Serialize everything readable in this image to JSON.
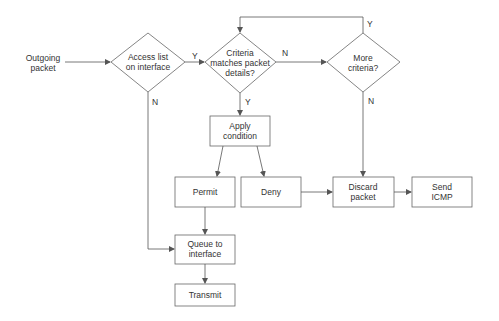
{
  "diagram": {
    "type": "flowchart",
    "start": {
      "label": "Outgoing\npacket"
    },
    "decisions": [
      {
        "id": "access_list",
        "label": "Access list\non interface"
      },
      {
        "id": "criteria_match",
        "label": "Criteria\nmatches packet\ndetails?"
      },
      {
        "id": "more_criteria",
        "label": "More\ncriteria?"
      }
    ],
    "processes": [
      {
        "id": "apply_condition",
        "label": "Apply\ncondition"
      },
      {
        "id": "permit",
        "label": "Permit"
      },
      {
        "id": "deny",
        "label": "Deny"
      },
      {
        "id": "discard_packet",
        "label": "Discard\npacket"
      },
      {
        "id": "send_icmp",
        "label": "Send\nICMP"
      },
      {
        "id": "queue",
        "label": "Queue to\ninterface"
      },
      {
        "id": "transmit",
        "label": "Transmit"
      }
    ],
    "edge_labels": {
      "access_yes": "Y",
      "access_no": "N",
      "criteria_no": "N",
      "criteria_yes": "Y",
      "more_yes": "Y",
      "more_no": "N"
    },
    "edges": [
      {
        "from": "start",
        "to": "access_list"
      },
      {
        "from": "access_list",
        "to": "criteria_match",
        "label": "Y"
      },
      {
        "from": "access_list",
        "to": "queue",
        "label": "N"
      },
      {
        "from": "criteria_match",
        "to": "more_criteria",
        "label": "N"
      },
      {
        "from": "criteria_match",
        "to": "apply_condition",
        "label": "Y"
      },
      {
        "from": "more_criteria",
        "to": "criteria_match",
        "label": "Y"
      },
      {
        "from": "more_criteria",
        "to": "discard_packet",
        "label": "N"
      },
      {
        "from": "apply_condition",
        "to": "permit"
      },
      {
        "from": "apply_condition",
        "to": "deny"
      },
      {
        "from": "permit",
        "to": "queue"
      },
      {
        "from": "deny",
        "to": "discard_packet"
      },
      {
        "from": "discard_packet",
        "to": "send_icmp"
      },
      {
        "from": "queue",
        "to": "transmit"
      }
    ]
  },
  "colors": {
    "stroke": "#555555",
    "text": "#333333",
    "background": "#ffffff"
  }
}
